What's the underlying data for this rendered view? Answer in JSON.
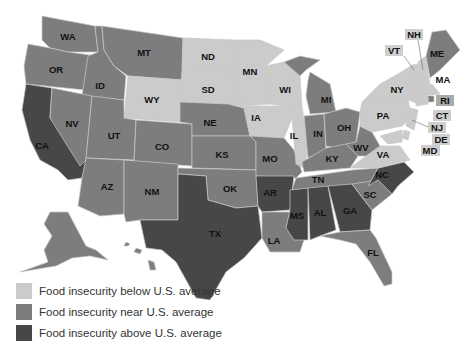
{
  "colors": {
    "below": "#cbcbcb",
    "near": "#7d7d7d",
    "above": "#474747",
    "background": "#ffffff"
  },
  "legend": [
    {
      "key": "below",
      "label": "Food insecurity below U.S. average"
    },
    {
      "key": "near",
      "label": "Food insecurity near U.S. average"
    },
    {
      "key": "above",
      "label": "Food insecurity above U.S. average"
    }
  ],
  "map": {
    "title": "",
    "categories": {
      "below": [
        "ND",
        "SD",
        "WY",
        "MN",
        "WI",
        "IA",
        "IL",
        "NH",
        "VT",
        "NY",
        "PA",
        "VA",
        "MA",
        "CT",
        "NJ",
        "DE",
        "MD"
      ],
      "near": [
        "WA",
        "OR",
        "ID",
        "MT",
        "NV",
        "UT",
        "CO",
        "AZ",
        "NM",
        "NE",
        "KS",
        "OK",
        "MO",
        "MI",
        "IN",
        "OH",
        "KY",
        "WV",
        "TN",
        "SC",
        "LA",
        "FL",
        "ME",
        "RI",
        "AK",
        "HI"
      ],
      "above": [
        "CA",
        "TX",
        "AR",
        "MS",
        "AL",
        "GA",
        "NC"
      ]
    },
    "labels": {
      "WA": "WA",
      "OR": "OR",
      "CA": "CA",
      "ID": "ID",
      "NV": "NV",
      "MT": "MT",
      "WY": "WY",
      "UT": "UT",
      "AZ": "AZ",
      "CO": "CO",
      "NM": "NM",
      "ND": "ND",
      "SD": "SD",
      "NE": "NE",
      "KS": "KS",
      "OK": "OK",
      "TX": "TX",
      "MN": "MN",
      "IA": "IA",
      "MO": "MO",
      "AR": "AR",
      "LA": "LA",
      "WI": "WI",
      "IL": "IL",
      "MI": "MI",
      "IN": "IN",
      "OH": "OH",
      "KY": "KY",
      "TN": "TN",
      "MS": "MS",
      "AL": "AL",
      "GA": "GA",
      "FL": "FL",
      "SC": "SC",
      "NC": "NC",
      "VA": "VA",
      "WV": "WV",
      "PA": "PA",
      "NY": "NY",
      "VT": "VT",
      "NH": "NH",
      "ME": "ME",
      "MA": "MA",
      "RI": "RI",
      "CT": "CT",
      "NJ": "NJ",
      "DE": "DE",
      "MD": "MD"
    }
  }
}
